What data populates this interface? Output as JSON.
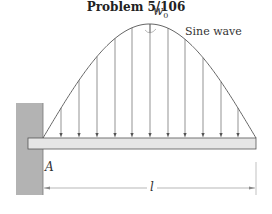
{
  "figure": {
    "caption": "Problem 5/106",
    "load_label": "w",
    "load_label_subscript": "0",
    "curve_label": "Sine wave",
    "support_label": "A",
    "length_label": "l"
  },
  "geometry": {
    "wall": {
      "x": 16,
      "y": 103,
      "w": 27,
      "h": 92,
      "color": "#b3b3b3"
    },
    "beam": {
      "x": 28,
      "y": 138,
      "w": 228,
      "h": 11,
      "color": "#e6e6e6"
    },
    "curve": {
      "x0": 43,
      "x1": 256,
      "baseline": 138,
      "peak": 24
    },
    "arrow_x": [
      61,
      79,
      97,
      115,
      132,
      150,
      168,
      185,
      203,
      221,
      238
    ],
    "dimension": {
      "y": 188,
      "x0": 43,
      "x1": 256
    }
  },
  "colors": {
    "line": "#555555",
    "wall": "#b3b3b3",
    "beam": "#e6e6e6"
  }
}
